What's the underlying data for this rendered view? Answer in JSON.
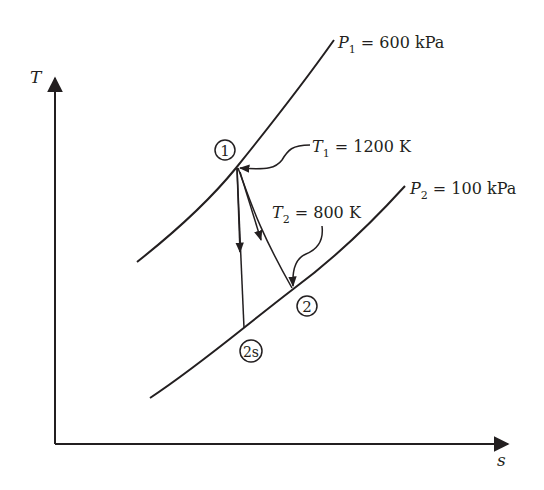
{
  "diagram": {
    "type": "T-s diagram (turbine expansion)",
    "axes": {
      "y_label": "T",
      "x_label": "s"
    },
    "isobars": [
      {
        "id": "P1",
        "label_var": "P",
        "label_sub": "1",
        "label_rest": " = 600 kPa",
        "pressure_kPa": 600
      },
      {
        "id": "P2",
        "label_var": "P",
        "label_sub": "2",
        "label_rest": " = 100 kPa",
        "pressure_kPa": 100
      }
    ],
    "states": [
      {
        "id": "1",
        "label": "1"
      },
      {
        "id": "2",
        "label": "2"
      },
      {
        "id": "2s",
        "label": "2s"
      }
    ],
    "annotations": [
      {
        "id": "T1",
        "label_var": "T",
        "label_sub": "1",
        "label_rest": " = 1200 K",
        "temperature_K": 1200,
        "points_to": "1"
      },
      {
        "id": "T2",
        "label_var": "T",
        "label_sub": "2",
        "label_rest": " = 800 K",
        "temperature_K": 800,
        "points_to": "2"
      }
    ],
    "processes": [
      {
        "from": "1",
        "to": "2s",
        "kind": "isentropic expansion (vertical)"
      },
      {
        "from": "1",
        "to": "2",
        "kind": "actual expansion"
      }
    ],
    "colors": {
      "ink": "#231f20",
      "background": "#ffffff"
    }
  }
}
